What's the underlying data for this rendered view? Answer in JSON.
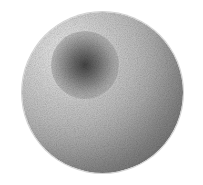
{
  "canvas": {
    "width": 203,
    "height": 185,
    "background_color": "#ffffff",
    "alt_text": "Grayscale shaded sphere with dark central spot"
  },
  "figure": {
    "subject_name": "shaded-sphere",
    "render_style": "dithered grayscale raster"
  },
  "sphere": {
    "center_x": 102,
    "center_y": 92,
    "diameter": 161,
    "radius": 80.5,
    "left": 22,
    "top": 12,
    "bounds": {
      "x_min": 22,
      "x_max": 183,
      "y_min": 12,
      "y_max": 173
    },
    "highlight": {
      "name": "specular-highlight",
      "x_percent": 28,
      "y_percent": 26,
      "color": "#ebebeb"
    },
    "midtone_color": "#c4c4c4",
    "terminator_color": "#8f8f8f",
    "shadow_color": "#737373",
    "rim_color": "#6e6e6e",
    "light_direction": "upper-left"
  },
  "core_spot": {
    "name": "dark-central-spot",
    "center_x": 85,
    "center_y": 65,
    "radius": 34,
    "inner_color": "#414141",
    "mid_color": "#6e6e6e",
    "outer_color": "#a8a8a8",
    "darkest_value": "#3f3f3f"
  },
  "texture": {
    "name": "dither-noise",
    "type": "ordered-dither",
    "strength": 0.5
  }
}
